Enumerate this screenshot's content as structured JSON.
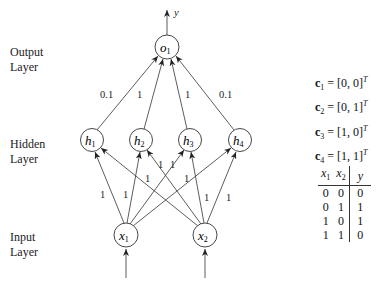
{
  "layers": {
    "output": [
      "Output",
      "Layer"
    ],
    "hidden": [
      "Hidden",
      "Layer"
    ],
    "input": [
      "Input",
      "Layer"
    ]
  },
  "output_arrow_label": "y",
  "nodes": {
    "o1": {
      "base": "o",
      "sub": "1"
    },
    "h1": {
      "base": "h",
      "sub": "1"
    },
    "h2": {
      "base": "h",
      "sub": "2"
    },
    "h3": {
      "base": "h",
      "sub": "3"
    },
    "h4": {
      "base": "h",
      "sub": "4"
    },
    "x1": {
      "base": "x",
      "sub": "1"
    },
    "x2": {
      "base": "x",
      "sub": "2"
    }
  },
  "weights": {
    "h1_o1": "0.1",
    "h2_o1": "1",
    "h3_o1": "1",
    "h4_o1": "0.1",
    "x1_h1": "1",
    "x1_h2": "1",
    "x1_h3": "1",
    "x1_h4": "1",
    "x2_h1": "1",
    "x2_h2": "1",
    "x2_h3": "1",
    "x2_h4": "1"
  },
  "vectors": [
    {
      "name": "c",
      "sub": "1",
      "value": "= [0, 0]",
      "sup": "T"
    },
    {
      "name": "c",
      "sub": "2",
      "value": "= [0, 1]",
      "sup": "T"
    },
    {
      "name": "c",
      "sub": "3",
      "value": "= [1, 0]",
      "sup": "T"
    },
    {
      "name": "c",
      "sub": "4",
      "value": "= [1, 1]",
      "sup": "T"
    }
  ],
  "truth_table": {
    "headers": [
      {
        "base": "x",
        "sub": "1"
      },
      {
        "base": "x",
        "sub": "2"
      },
      {
        "base": "y",
        "sub": ""
      }
    ],
    "rows": [
      [
        "0",
        "0",
        "0"
      ],
      [
        "0",
        "1",
        "1"
      ],
      [
        "1",
        "0",
        "1"
      ],
      [
        "1",
        "1",
        "0"
      ]
    ]
  }
}
